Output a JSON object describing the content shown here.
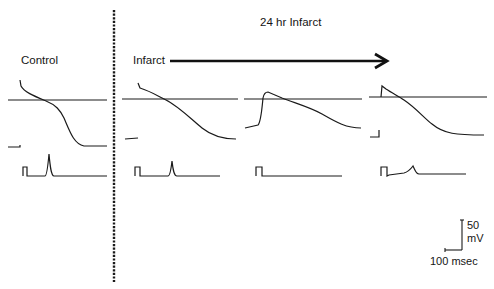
{
  "figure": {
    "title": "24 hr Infarct",
    "panels": [
      {
        "label": "Control"
      },
      {
        "label": "Infarct"
      },
      {
        "label": ""
      },
      {
        "label": ""
      }
    ],
    "arrow": {
      "direction": "right",
      "from_label": "Infarct"
    },
    "divider": {
      "style": "dashed-vertical"
    },
    "scale_bar": {
      "vertical_value": "50",
      "vertical_unit": "mV",
      "horizontal_label": "100 msec"
    },
    "trace_color": "#1a1a1a"
  }
}
